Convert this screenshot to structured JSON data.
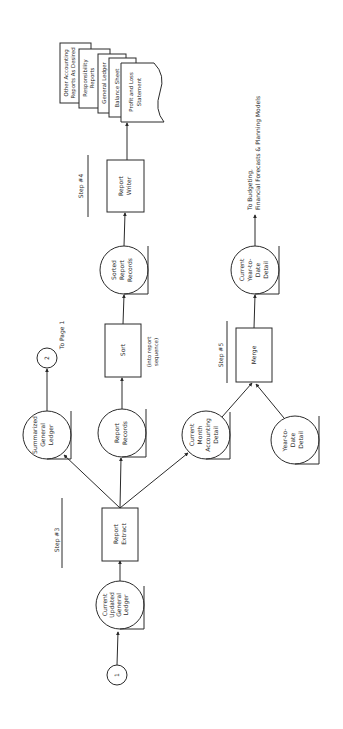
{
  "diagram": {
    "orientation": "rotated-90-ccw",
    "connectors": {
      "in": {
        "label": "1"
      },
      "out": {
        "label": "2",
        "note": "To Page 1"
      }
    },
    "steps": {
      "step3": "Step #3",
      "step4": "Step #4",
      "step5": "Step #5"
    },
    "files": {
      "current_updated_gl": [
        "Current",
        "Updated",
        "General",
        "Ledger"
      ],
      "summarized_gl": [
        "Summarized",
        "General",
        "Ledger"
      ],
      "report_records": [
        "Report",
        "Records"
      ],
      "current_month_detail": [
        "Current",
        "Month",
        "Accounting",
        "Detail"
      ],
      "ytd_detail": [
        "Year-to-",
        "Date",
        "Detail"
      ],
      "sorted_report_records": [
        "Sorted",
        "Report",
        "Records"
      ],
      "current_ytd_detail": [
        "Current",
        "Year-to-",
        "Date",
        "Detail"
      ]
    },
    "processes": {
      "report_extract": [
        "Report",
        "Extract"
      ],
      "sort": [
        "Sort"
      ],
      "sort_note": [
        "(into report",
        "sequence)"
      ],
      "merge": [
        "Merge"
      ],
      "report_writer": [
        "Report",
        "Writer"
      ]
    },
    "reports": [
      [
        "Profit and Loss",
        "Statement"
      ],
      [
        "Balance Sheet"
      ],
      [
        "General Ledger"
      ],
      [
        "Responsibility",
        "Reports"
      ],
      [
        "Other Accounting",
        "Reports As Desired"
      ]
    ],
    "output_note": [
      "To Budgeting,",
      "Financial Forecasts & Planning Models"
    ]
  }
}
